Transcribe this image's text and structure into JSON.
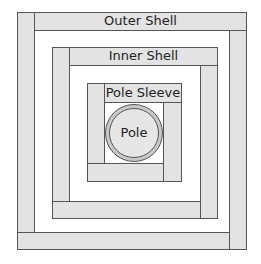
{
  "diagram": {
    "type": "nested-square-frames",
    "layers": [
      {
        "id": "outer",
        "label": "Outer Shell"
      },
      {
        "id": "inner",
        "label": "Inner Shell"
      },
      {
        "id": "sleeve",
        "label": "Pole Sleeve"
      },
      {
        "id": "pole",
        "label": "Pole"
      }
    ],
    "colors": {
      "fill": "#e3e3e3",
      "stroke": "#555555",
      "background": "#ffffff",
      "text": "#222222"
    }
  }
}
